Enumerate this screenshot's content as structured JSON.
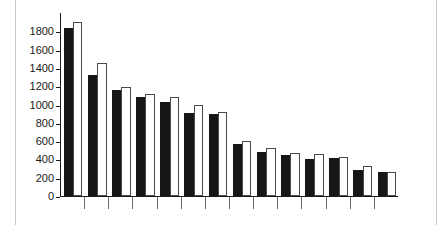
{
  "figure": {
    "background_color": "#ffffff",
    "rule_color": "#c9c9c9"
  },
  "chart_data": {
    "type": "bar",
    "title": "",
    "subtitle": "",
    "xlabel": "",
    "ylabel": "",
    "categories": [
      "1",
      "2",
      "3",
      "4",
      "5",
      "6",
      "7",
      "8",
      "9",
      "10",
      "11",
      "12",
      "13",
      "14"
    ],
    "series": [
      {
        "name": "Series 1",
        "color": "#161616",
        "style": "filled-black",
        "values": [
          1840,
          1325,
          1155,
          1080,
          1025,
          905,
          895,
          570,
          485,
          445,
          410,
          415,
          285,
          260
        ]
      },
      {
        "name": "Series 2",
        "color": "#ffffff",
        "style": "outlined-white",
        "values": [
          1900,
          1455,
          1195,
          1120,
          1080,
          990,
          915,
          605,
          530,
          465,
          460,
          425,
          325,
          260
        ]
      }
    ],
    "ylim": [
      0,
      2000
    ],
    "xlim": [
      0,
      14
    ],
    "yticks": [
      0,
      200,
      400,
      600,
      800,
      1000,
      1200,
      1400,
      1600,
      1800
    ],
    "ytick_labels": [
      "0",
      "200",
      "400",
      "600",
      "800",
      "1000",
      "1200",
      "1400",
      "1600",
      "1800"
    ],
    "xtick_labels": [
      "",
      "",
      "",
      "",
      "",
      "",
      "",
      "",
      "",
      "",
      "",
      "",
      "",
      ""
    ],
    "grid": false,
    "legend": "none",
    "axis_color": "#1a1a1a",
    "tick_color": "#6f6f6f"
  }
}
